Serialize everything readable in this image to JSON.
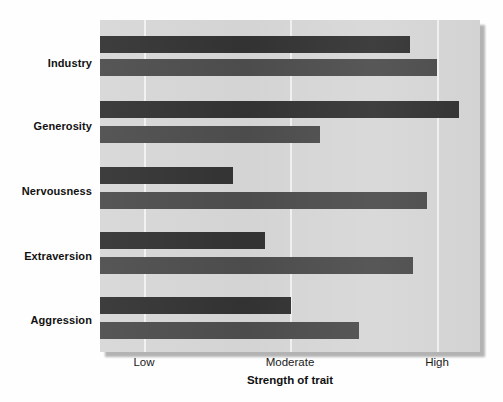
{
  "chart_data": {
    "type": "bar",
    "orientation": "horizontal",
    "title": "",
    "xlabel": "Strength of trait",
    "ylabel": "",
    "categories": [
      "Industry",
      "Generosity",
      "Nervousness",
      "Extraversion",
      "Aggression"
    ],
    "x_tick_labels": [
      "Low",
      "Moderate",
      "High"
    ],
    "x_tick_values": [
      1,
      2,
      3
    ],
    "xlim": [
      0.7,
      3.3
    ],
    "grid": "vertical-only",
    "legend": "none",
    "series": [
      {
        "name": "bar-top",
        "color": "#333333",
        "values": [
          2.82,
          3.16,
          1.61,
          1.83,
          2.01
        ]
      },
      {
        "name": "bar-bottom",
        "color": "#4d4d4d",
        "values": [
          3.0,
          2.2,
          2.94,
          2.66,
          2.48
        ]
      }
    ]
  },
  "axis": {
    "x_title": "Strength of trait",
    "ticks": [
      {
        "label": "Low",
        "px": 144
      },
      {
        "label": "Moderate",
        "px": 290
      },
      {
        "label": "High",
        "px": 437
      }
    ]
  },
  "groups": [
    {
      "label": "Industry",
      "label_y": 64,
      "bars": [
        {
          "name": "industry-bar-top",
          "y": 36,
          "end_px": 410,
          "series": 0
        },
        {
          "name": "industry-bar-bottom",
          "y": 59,
          "end_px": 437,
          "series": 1
        }
      ]
    },
    {
      "label": "Generosity",
      "label_y": 127,
      "bars": [
        {
          "name": "generosity-bar-top",
          "y": 101,
          "end_px": 459,
          "series": 0
        },
        {
          "name": "generosity-bar-bottom",
          "y": 126,
          "end_px": 320,
          "series": 1
        }
      ]
    },
    {
      "label": "Nervousness",
      "label_y": 192,
      "bars": [
        {
          "name": "nervousness-bar-top",
          "y": 167,
          "end_px": 233,
          "series": 0
        },
        {
          "name": "nervousness-bar-bottom",
          "y": 192,
          "end_px": 427,
          "series": 1
        }
      ]
    },
    {
      "label": "Extraversion",
      "label_y": 257,
      "bars": [
        {
          "name": "extraversion-bar-top",
          "y": 232,
          "end_px": 265,
          "series": 0
        },
        {
          "name": "extraversion-bar-bottom",
          "y": 257,
          "end_px": 413,
          "series": 1
        }
      ]
    },
    {
      "label": "Aggression",
      "label_y": 321,
      "bars": [
        {
          "name": "aggression-bar-top",
          "y": 297,
          "end_px": 291,
          "series": 0
        },
        {
          "name": "aggression-bar-bottom",
          "y": 322,
          "end_px": 359,
          "series": 1
        }
      ]
    }
  ],
  "colors": {
    "plot_background": "#d7d7d7",
    "gridline": "#f2f2f2",
    "bar_top": "#333333",
    "bar_bottom": "#4d4d4d",
    "text": "#111111",
    "page_background": "#fefefe"
  }
}
